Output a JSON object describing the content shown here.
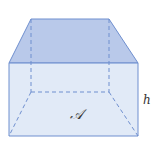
{
  "diagram": {
    "type": "trapezoidal-prism",
    "labels": {
      "area": "𝒜",
      "height": "h"
    },
    "colors": {
      "top_face": "#b9c9ea",
      "front_face": "#dce6f6",
      "edge": "#6f8fcf",
      "hidden_edge": "#6f8fcf"
    },
    "vertices": {
      "top_back_left": [
        31,
        19
      ],
      "top_back_right": [
        109,
        19
      ],
      "top_front_left": [
        9,
        63
      ],
      "top_front_right": [
        138,
        63
      ],
      "bottom_front_left": [
        9,
        136
      ],
      "bottom_front_right": [
        138,
        136
      ],
      "bottom_back_left": [
        31,
        92
      ],
      "bottom_back_right": [
        109,
        92
      ]
    }
  }
}
